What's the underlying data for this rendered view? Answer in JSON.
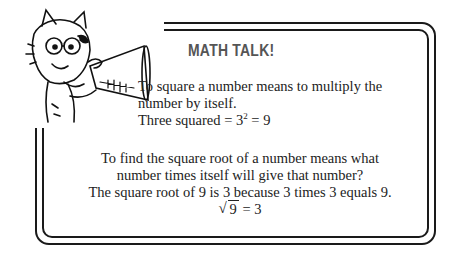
{
  "title": "MATH TALK!",
  "square": {
    "line1": "To square a number means to multiply the",
    "line2": "number by itself.",
    "line3_prefix": "Three squared = 3",
    "line3_exp": "2",
    "line3_suffix": " = 9"
  },
  "root": {
    "line1": "To find the square root of a number means what",
    "line2": "number times itself will give that number?",
    "line3": "The square root of 9 is 3 because 3 times 3 equals 9.",
    "radicand": "9",
    "radical_result": " = 3"
  },
  "illustration": {
    "subject": "cartoon cat with glasses holding megaphone"
  }
}
